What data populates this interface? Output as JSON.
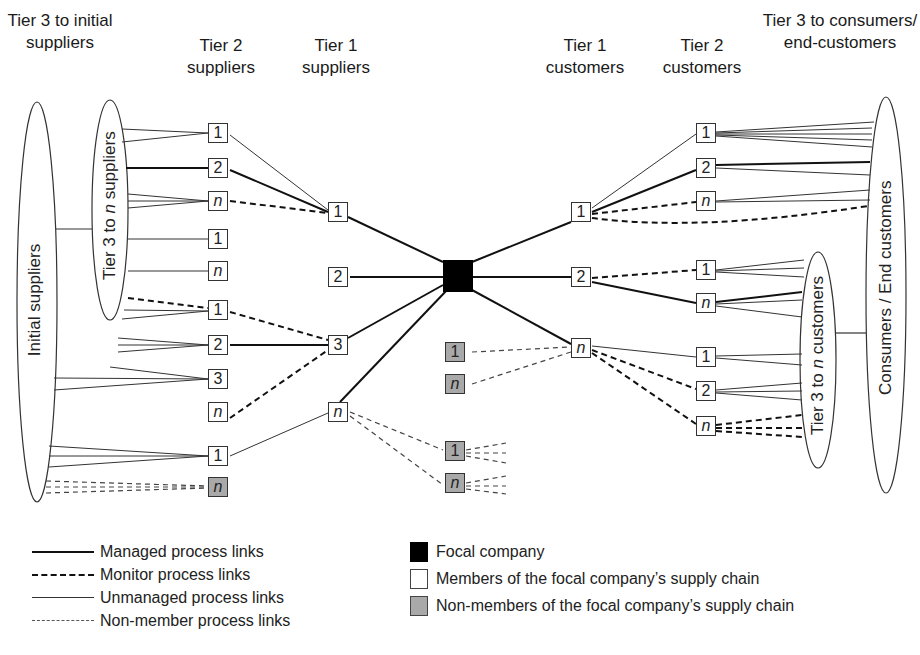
{
  "headers": {
    "tier3_initial_suppliers": "Tier 3 to initial suppliers",
    "tier2_suppliers": "Tier 2 suppliers",
    "tier1_suppliers": "Tier 1 suppliers",
    "tier1_customers": "Tier 1 customers",
    "tier2_customers": "Tier 2 customers",
    "tier3_consumers": "Tier 3 to consumers/ end-customers"
  },
  "ovals": {
    "initial_suppliers": "Initial suppliers",
    "tier3_to_n_suppliers_pre": "Tier 3 to ",
    "tier3_to_n_suppliers_n": "n",
    "tier3_to_n_suppliers_post": " suppliers",
    "tier3_to_n_customers_pre": "Tier 3 to ",
    "tier3_to_n_customers_n": "n",
    "tier3_to_n_customers_post": " customers",
    "consumers_end_customers": "Consumers / End customers"
  },
  "nodes": {
    "tier2_suppliers": [
      "1",
      "2",
      "n",
      "1",
      "n",
      "1",
      "2",
      "3",
      "n",
      "1",
      "n"
    ],
    "tier1_suppliers": [
      "1",
      "2",
      "3",
      "n"
    ],
    "focal": "",
    "non_members_center": [
      "1",
      "n",
      "1",
      "n"
    ],
    "tier1_customers": [
      "1",
      "2",
      "n"
    ],
    "tier2_customers": [
      "1",
      "2",
      "n",
      "1",
      "n",
      "1",
      "2",
      "n"
    ]
  },
  "legend": {
    "links": [
      {
        "label": "Managed process links",
        "style": "managed"
      },
      {
        "label": "Monitor process links",
        "style": "monitor"
      },
      {
        "label": "Unmanaged process links",
        "style": "unmanaged"
      },
      {
        "label": "Non-member process links",
        "style": "non-member"
      }
    ],
    "nodes": [
      {
        "label": "Focal company",
        "color": "#000000"
      },
      {
        "label": "Members of the focal company’s supply chain",
        "color": "#ffffff"
      },
      {
        "label": "Non-members of the focal company’s supply chain",
        "color": "#a9a9a9"
      }
    ]
  },
  "colors": {
    "line": "#222222",
    "non_member_fill": "#a9a9a9",
    "focal_fill": "#000000"
  }
}
